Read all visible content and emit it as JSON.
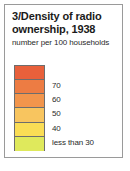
{
  "legend": {
    "title": "3/Density of radio ownership, 1938",
    "subtitle": "number per 100 households",
    "border_color": "#9a9a9a",
    "swatch_border_color": "#6d6d6d",
    "classes": [
      {
        "label": "",
        "color": "#e8603b",
        "label_visible": false
      },
      {
        "label": "70",
        "color": "#ed7c43",
        "label_visible": true
      },
      {
        "label": "60",
        "color": "#f2954c",
        "label_visible": true
      },
      {
        "label": "50",
        "color": "#f8c55f",
        "label_visible": true
      },
      {
        "label": "40",
        "color": "#fadd55",
        "label_visible": true
      },
      {
        "label": "less than 30",
        "color": "#dfe95c",
        "label_visible": true
      }
    ]
  },
  "chart_data": {
    "type": "table",
    "title": "3/Density of radio ownership, 1938",
    "subtitle": "number per 100 households",
    "xlabel": "",
    "ylabel": "number per 100 households",
    "legend_position": "standalone",
    "grid": false,
    "categories": [
      "80 and over",
      "70",
      "60",
      "50",
      "40",
      "less than 30"
    ],
    "tick_labels": [
      "70",
      "60",
      "50",
      "40",
      "less than 30"
    ],
    "colors": [
      "#e8603b",
      "#ed7c43",
      "#f2954c",
      "#f8c55f",
      "#fadd55",
      "#dfe95c"
    ],
    "values": [
      6,
      5,
      4,
      3,
      2,
      1
    ],
    "ylim": [
      30,
      80
    ]
  }
}
